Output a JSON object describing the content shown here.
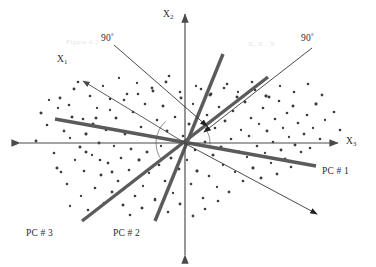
{
  "figure": {
    "kind": "pca-axis-rotation-scatter-diagram",
    "background_color": "#ffffff"
  },
  "colors": {
    "axis": "#4a4a4a",
    "pc_line": "#5b5b5b",
    "annotation_line": "#2b2b2b",
    "point": "#3c3c3c",
    "text": "#2b2b2b",
    "watermark": "#e3e3e3"
  },
  "axes": [
    {
      "id": "x2",
      "label": "X",
      "sub": "2",
      "label_x": 163,
      "label_y": 9,
      "x1": 185,
      "y1": 255,
      "x2": 185,
      "y2": 14,
      "arrow_both": true
    },
    {
      "id": "x3",
      "label": "X",
      "sub": "3",
      "label_x": 346,
      "label_y": 136,
      "x1": 20,
      "y1": 143,
      "x2": 338,
      "y2": 143,
      "arrow_both": true
    },
    {
      "id": "x1",
      "label": "X",
      "sub": "1",
      "label_x": 57,
      "label_y": 54,
      "x1": 185,
      "y1": 143,
      "x2": 83,
      "y2": 81,
      "arrow_both": false
    }
  ],
  "pc_axes": [
    {
      "id": "pc1",
      "label": "PC # 1",
      "label_x": 322,
      "label_y": 166,
      "x1": 55,
      "y1": 119,
      "x2": 316,
      "y2": 166
    },
    {
      "id": "pc2",
      "label": "PC # 2",
      "label_x": 113,
      "label_y": 228,
      "x1": 155,
      "y1": 221,
      "x2": 223,
      "y2": 54
    },
    {
      "id": "pc3",
      "label": "PC # 3",
      "label_x": 26,
      "label_y": 228,
      "x1": 82,
      "y1": 221,
      "x2": 268,
      "y2": 77
    }
  ],
  "annotations": [
    {
      "id": "angle-left",
      "label": "90",
      "degree": "°",
      "label_x": 101,
      "label_y": 33,
      "x1": 114,
      "y1": 45,
      "x2": 207,
      "y2": 126
    },
    {
      "id": "angle-right",
      "label": "90",
      "degree": "°",
      "label_x": 301,
      "label_y": 33,
      "x1": 312,
      "y1": 48,
      "x2": 204,
      "y2": 132
    },
    {
      "id": "pc1-pointer",
      "label": "",
      "degree": "",
      "label_x": 0,
      "label_y": 0,
      "x1": 186,
      "y1": 144,
      "x2": 317,
      "y2": 214
    }
  ],
  "angle_arcs": [
    {
      "id": "arc-left",
      "cx": 185,
      "cy": 143,
      "r": 29,
      "start_deg": 132,
      "end_deg": 218
    },
    {
      "id": "arc-right",
      "cx": 185,
      "cy": 143,
      "r": 25,
      "start_deg": 38,
      "end_deg": -4
    }
  ],
  "watermarks": [
    {
      "id": "watermark-left",
      "text": "Figure 4.2",
      "x": 66,
      "y": 38
    },
    {
      "id": "watermark-right",
      "text": "X, X , X",
      "x": 248,
      "y": 40
    }
  ],
  "chart_data": {
    "type": "scatter",
    "title": "",
    "xlabel": "X_3",
    "ylabel": "X_2",
    "grid": false,
    "legend": "none",
    "xlim": [
      0,
      376
    ],
    "ylim": [
      267,
      0
    ],
    "note": "Cloud of data points in pixel coordinates; origin of the X1/X2/X3 axis system is (185,143).",
    "points": [
      [
        36,
        141
      ],
      [
        41,
        113
      ],
      [
        47,
        125
      ],
      [
        49,
        100
      ],
      [
        54,
        153
      ],
      [
        57,
        168
      ],
      [
        58,
        108
      ],
      [
        60,
        98
      ],
      [
        61,
        172
      ],
      [
        64,
        131
      ],
      [
        67,
        184
      ],
      [
        69,
        105
      ],
      [
        70,
        206
      ],
      [
        72,
        117
      ],
      [
        74,
        89
      ],
      [
        75,
        160
      ],
      [
        78,
        82
      ],
      [
        80,
        147
      ],
      [
        81,
        196
      ],
      [
        83,
        119
      ],
      [
        84,
        171
      ],
      [
        86,
        134
      ],
      [
        88,
        210
      ],
      [
        90,
        96
      ],
      [
        92,
        155
      ],
      [
        93,
        124
      ],
      [
        95,
        188
      ],
      [
        97,
        108
      ],
      [
        99,
        143
      ],
      [
        101,
        175
      ],
      [
        103,
        86
      ],
      [
        104,
        203
      ],
      [
        106,
        130
      ],
      [
        108,
        163
      ],
      [
        110,
        99
      ],
      [
        112,
        192
      ],
      [
        114,
        146
      ],
      [
        116,
        118
      ],
      [
        118,
        181
      ],
      [
        119,
        78
      ],
      [
        121,
        158
      ],
      [
        123,
        205
      ],
      [
        125,
        134
      ],
      [
        127,
        94
      ],
      [
        129,
        170
      ],
      [
        131,
        149
      ],
      [
        133,
        112
      ],
      [
        135,
        196
      ],
      [
        137,
        83
      ],
      [
        139,
        160
      ],
      [
        141,
        127
      ],
      [
        143,
        186
      ],
      [
        145,
        104
      ],
      [
        147,
        152
      ],
      [
        149,
        173
      ],
      [
        151,
        137
      ],
      [
        153,
        91
      ],
      [
        155,
        200
      ],
      [
        157,
        120
      ],
      [
        159,
        165
      ],
      [
        161,
        146
      ],
      [
        163,
        106
      ],
      [
        165,
        181
      ],
      [
        167,
        131
      ],
      [
        169,
        76
      ],
      [
        171,
        158
      ],
      [
        173,
        193
      ],
      [
        175,
        117
      ],
      [
        177,
        148
      ],
      [
        179,
        169
      ],
      [
        181,
        98
      ],
      [
        183,
        136
      ],
      [
        187,
        160
      ],
      [
        189,
        124
      ],
      [
        191,
        184
      ],
      [
        193,
        104
      ],
      [
        195,
        150
      ],
      [
        197,
        171
      ],
      [
        199,
        131
      ],
      [
        201,
        89
      ],
      [
        203,
        198
      ],
      [
        205,
        142
      ],
      [
        207,
        115
      ],
      [
        209,
        176
      ],
      [
        211,
        94
      ],
      [
        213,
        155
      ],
      [
        215,
        128
      ],
      [
        217,
        187
      ],
      [
        219,
        107
      ],
      [
        221,
        147
      ],
      [
        223,
        165
      ],
      [
        225,
        121
      ],
      [
        227,
        84
      ],
      [
        229,
        192
      ],
      [
        231,
        139
      ],
      [
        233,
        111
      ],
      [
        235,
        172
      ],
      [
        237,
        97
      ],
      [
        239,
        152
      ],
      [
        241,
        130
      ],
      [
        243,
        181
      ],
      [
        245,
        102
      ],
      [
        247,
        157
      ],
      [
        249,
        136
      ],
      [
        251,
        118
      ],
      [
        253,
        168
      ],
      [
        255,
        90
      ],
      [
        257,
        146
      ],
      [
        259,
        124
      ],
      [
        261,
        178
      ],
      [
        263,
        108
      ],
      [
        265,
        153
      ],
      [
        267,
        131
      ],
      [
        269,
        97
      ],
      [
        271,
        163
      ],
      [
        273,
        142
      ],
      [
        275,
        119
      ],
      [
        277,
        174
      ],
      [
        279,
        101
      ],
      [
        281,
        150
      ],
      [
        283,
        128
      ],
      [
        285,
        159
      ],
      [
        287,
        113
      ],
      [
        289,
        137
      ],
      [
        291,
        167
      ],
      [
        293,
        106
      ],
      [
        295,
        145
      ],
      [
        298,
        123
      ],
      [
        301,
        152
      ],
      [
        304,
        134
      ],
      [
        307,
        115
      ],
      [
        310,
        148
      ],
      [
        313,
        128
      ],
      [
        316,
        104
      ],
      [
        320,
        139
      ],
      [
        325,
        120
      ],
      [
        130,
        215
      ],
      [
        142,
        208
      ],
      [
        155,
        199
      ],
      [
        168,
        212
      ],
      [
        180,
        204
      ],
      [
        193,
        216
      ],
      [
        205,
        209
      ],
      [
        218,
        201
      ],
      [
        70,
        138
      ],
      [
        86,
        152
      ],
      [
        100,
        160
      ],
      [
        112,
        172
      ],
      [
        124,
        189
      ],
      [
        96,
        118
      ],
      [
        110,
        110
      ],
      [
        124,
        100
      ],
      [
        138,
        94
      ],
      [
        152,
        88
      ],
      [
        166,
        82
      ],
      [
        180,
        92
      ],
      [
        196,
        86
      ],
      [
        210,
        95
      ],
      [
        224,
        88
      ],
      [
        238,
        92
      ],
      [
        252,
        82
      ],
      [
        266,
        96
      ],
      [
        280,
        86
      ],
      [
        294,
        92
      ],
      [
        308,
        84
      ],
      [
        322,
        95
      ],
      [
        334,
        112
      ],
      [
        340,
        130
      ]
    ]
  }
}
